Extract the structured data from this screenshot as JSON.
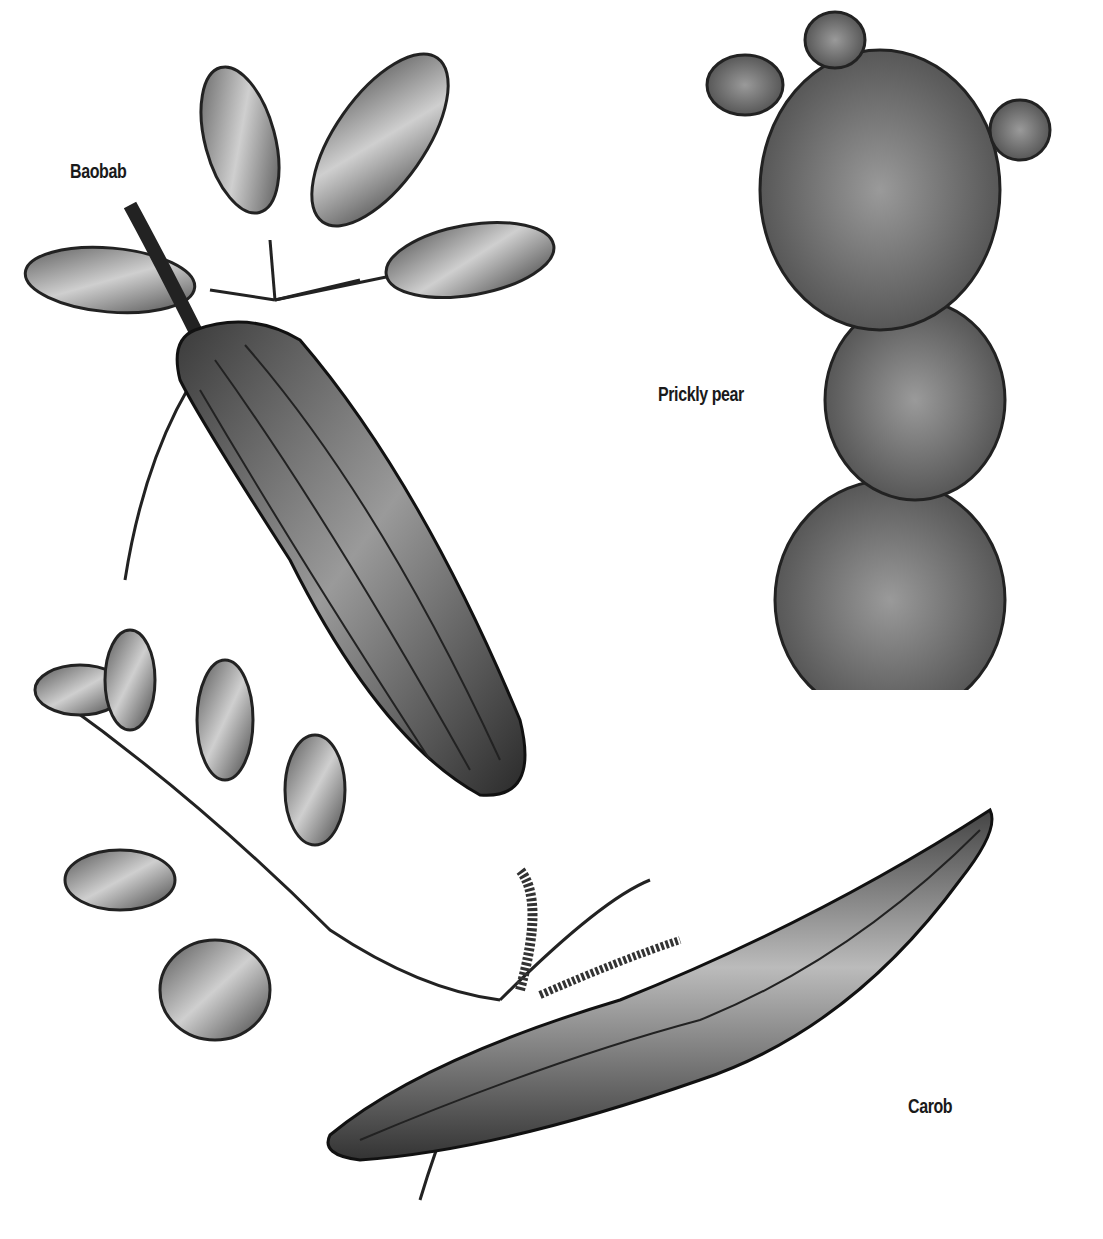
{
  "illustration": {
    "style": "black-and-white botanical engraving",
    "background": "#ffffff",
    "ink": "#1a1a1a",
    "labels": [
      {
        "text": "Baobab",
        "x": 70,
        "y": 160
      },
      {
        "text": "Prickly pear",
        "x": 658,
        "y": 383
      },
      {
        "text": "Carob",
        "x": 908,
        "y": 1095
      }
    ],
    "subjects": [
      {
        "name": "Baobab",
        "parts": [
          "leaf cluster",
          "elongated ribbed fruit pod"
        ]
      },
      {
        "name": "Prickly pear",
        "parts": [
          "stacked cactus pads with spines"
        ]
      },
      {
        "name": "Carob",
        "parts": [
          "compound leaf branch",
          "catkin flowers",
          "long curved seed pod"
        ]
      }
    ]
  }
}
